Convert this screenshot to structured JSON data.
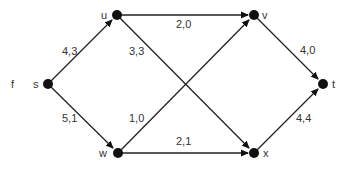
{
  "graph": {
    "side_label": "f",
    "nodes": [
      {
        "id": "s",
        "label": "s",
        "x": 48,
        "y": 84
      },
      {
        "id": "u",
        "label": "u",
        "x": 117,
        "y": 15
      },
      {
        "id": "v",
        "label": "v",
        "x": 254,
        "y": 15
      },
      {
        "id": "w",
        "label": "w",
        "x": 118,
        "y": 153
      },
      {
        "id": "x",
        "label": "x",
        "x": 254,
        "y": 153
      },
      {
        "id": "t",
        "label": "t",
        "x": 323,
        "y": 84
      }
    ],
    "edges": [
      {
        "from": "s",
        "to": "u",
        "label": "4,3"
      },
      {
        "from": "s",
        "to": "w",
        "label": "5,1"
      },
      {
        "from": "u",
        "to": "v",
        "label": "2,0"
      },
      {
        "from": "u",
        "to": "x",
        "label": "3,3"
      },
      {
        "from": "w",
        "to": "v",
        "label": "1,0"
      },
      {
        "from": "w",
        "to": "x",
        "label": "2,1"
      },
      {
        "from": "v",
        "to": "t",
        "label": "4,0"
      },
      {
        "from": "x",
        "to": "t",
        "label": "4,4"
      }
    ]
  }
}
